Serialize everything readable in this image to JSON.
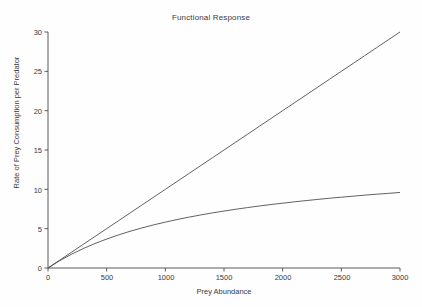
{
  "figure": {
    "title": "Functional Response",
    "background_color": "#fefefe",
    "axis_color": "#4a4a4a",
    "line_color": "#444444",
    "text_color": "#3a3a3a"
  },
  "axes": {
    "xlabel": "Prey Abundance",
    "ylabel": "Rate of Prey Consumption per Predator",
    "xticks": [
      "0",
      "500",
      "1000",
      "1500",
      "2000",
      "2500",
      "3000"
    ],
    "yticks": [
      "0",
      "5",
      "10",
      "15",
      "20",
      "25",
      "30"
    ]
  },
  "chart_data": {
    "type": "line",
    "title": "Functional Response",
    "xlabel": "Prey Abundance",
    "ylabel": "Rate of Prey Consumption per Predator",
    "xlim": [
      0,
      3000
    ],
    "ylim": [
      0,
      30
    ],
    "xticks": [
      0,
      500,
      1000,
      1500,
      2000,
      2500,
      3000
    ],
    "yticks": [
      0,
      5,
      10,
      15,
      20,
      25,
      30
    ],
    "grid": false,
    "legend": null,
    "x": [
      0,
      100,
      200,
      300,
      400,
      500,
      600,
      700,
      800,
      900,
      1000,
      1100,
      1200,
      1300,
      1400,
      1500,
      1600,
      1700,
      1800,
      1900,
      2000,
      2100,
      2200,
      2300,
      2400,
      2500,
      2600,
      2700,
      2800,
      2900,
      3000
    ],
    "series": [
      {
        "name": "Type I (linear) functional response",
        "formula": "f(N) = 0.01 N",
        "values": [
          0,
          1.0,
          2.0,
          3.0,
          4.0,
          5.0,
          6.0,
          7.0,
          8.0,
          9.0,
          10.0,
          11.0,
          12.0,
          13.0,
          14.0,
          15.0,
          16.0,
          17.0,
          18.0,
          19.0,
          20.0,
          21.0,
          22.0,
          23.0,
          24.0,
          25.0,
          26.0,
          27.0,
          28.0,
          29.0,
          30.0
        ]
      },
      {
        "name": "Type II (saturating) functional response",
        "formula": "f(N) = 0.01 N / (1 + 0.01 N / 14)",
        "asymptote": 14,
        "values": [
          0,
          0.93,
          1.75,
          2.47,
          3.11,
          3.68,
          4.2,
          4.67,
          5.09,
          5.48,
          5.83,
          6.16,
          6.46,
          6.74,
          7.0,
          7.24,
          7.47,
          7.68,
          7.88,
          8.07,
          8.24,
          8.41,
          8.57,
          8.72,
          8.87,
          9.0,
          9.13,
          9.26,
          9.38,
          9.49,
          9.6
        ]
      }
    ]
  }
}
